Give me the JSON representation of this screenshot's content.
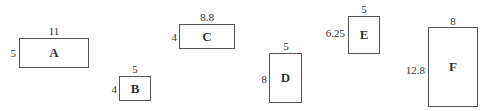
{
  "shapes": [
    {
      "name": "A",
      "width_label": "11",
      "height_label": "5",
      "box": [
        19,
        38,
        70,
        30
      ]
    },
    {
      "name": "B",
      "width_label": "5",
      "height_label": "4",
      "box": [
        119,
        76,
        32,
        25
      ]
    },
    {
      "name": "C",
      "width_label": "8.8",
      "height_label": "4",
      "box": [
        179,
        24,
        56,
        25
      ]
    },
    {
      "name": "D",
      "width_label": "5",
      "height_label": "8",
      "box": [
        269,
        53,
        33,
        50
      ]
    },
    {
      "name": "E",
      "width_label": "5",
      "height_label": "6.25",
      "box": [
        348,
        16,
        32,
        38
      ]
    },
    {
      "name": "F",
      "width_label": "8",
      "height_label": "12.8",
      "box": [
        428,
        27,
        50,
        80
      ]
    }
  ]
}
